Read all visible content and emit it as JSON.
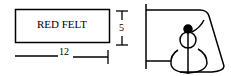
{
  "diagram": {
    "rectangle_label": "RED FELT",
    "width_dimension": "12",
    "height_dimension": "5",
    "figure": "snowman-in-cone"
  }
}
